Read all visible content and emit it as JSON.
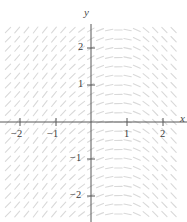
{
  "chart_data": {
    "type": "slope-field",
    "title": "",
    "xlabel": "x",
    "ylabel": "y",
    "xlim": [
      -2.4,
      2.4
    ],
    "ylim": [
      -2.5,
      2.5
    ],
    "xticks": [
      -2,
      -1,
      1,
      2
    ],
    "yticks": [
      -2,
      -1,
      1,
      2
    ],
    "xtick_labels": [
      "−2",
      "−1",
      "1",
      "2"
    ],
    "ytick_labels": [
      "−2",
      "−1",
      "1",
      "2"
    ],
    "grid": false,
    "legend": false,
    "slope_formula_note": "angle rotates from steep positive on the left to shallow negative on the right; symmetric about the x-axis",
    "mark_color": "#d9d9d9",
    "axis_color": "#555555",
    "sample_slope_angles_deg": {
      "x_-2": 72,
      "x_-1": 60,
      "x_0": 30,
      "x_1": 2,
      "x_2": -28
    },
    "mark_spacing_px": 9.2,
    "mark_length_px": 7.5
  },
  "axes": {
    "y_label": "y",
    "x_label": "x",
    "origin_px": [
      91,
      122
    ],
    "unit_px": 35.5
  },
  "ticks": {
    "x": [
      {
        "value": -2,
        "label": "−2",
        "px": 20
      },
      {
        "value": -1,
        "label": "−1",
        "px": 56
      },
      {
        "value": 1,
        "label": "1",
        "px": 127
      },
      {
        "value": 2,
        "label": "2",
        "px": 163
      }
    ],
    "y": [
      {
        "value": 2,
        "label": "2",
        "px": 48
      },
      {
        "value": 1,
        "label": "1",
        "px": 85
      },
      {
        "value": -1,
        "label": "−1",
        "px": 159
      },
      {
        "value": -2,
        "label": "−2",
        "px": 196
      }
    ]
  },
  "colors": {
    "background": "#ffffff",
    "slope_mark": "#dcdcdc",
    "axis": "#595959",
    "text": "#3b3b3b"
  }
}
